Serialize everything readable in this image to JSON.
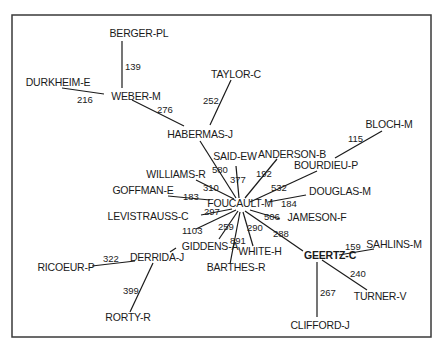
{
  "frame": {
    "x": 12,
    "y": 15,
    "width": 419,
    "height": 322
  },
  "nodes": [
    {
      "id": "BERGER-PL",
      "label": "BERGER-PL",
      "x": 139,
      "y": 37,
      "anchor": "middle"
    },
    {
      "id": "DURKHEIM-E",
      "label": "DURKHEIM-E",
      "x": 58,
      "y": 86,
      "anchor": "middle"
    },
    {
      "id": "WEBER-M",
      "label": "WEBER-M",
      "x": 136,
      "y": 100,
      "anchor": "middle"
    },
    {
      "id": "TAYLOR-C",
      "label": "TAYLOR-C",
      "x": 236,
      "y": 78,
      "anchor": "middle"
    },
    {
      "id": "HABERMAS-J",
      "label": "HABERMAS-J",
      "x": 200,
      "y": 138,
      "anchor": "middle"
    },
    {
      "id": "BLOCH-M",
      "label": "BLOCH-M",
      "x": 389,
      "y": 128,
      "anchor": "middle"
    },
    {
      "id": "SAID-EW",
      "label": "SAID-EW",
      "x": 235,
      "y": 160,
      "anchor": "middle"
    },
    {
      "id": "ANDERSON-B",
      "label": "ANDERSON-B",
      "x": 292,
      "y": 158,
      "anchor": "middle"
    },
    {
      "id": "BOURDIEU-P",
      "label": "BOURDIEU-P",
      "x": 326,
      "y": 169,
      "anchor": "middle"
    },
    {
      "id": "WILLIAMS-R",
      "label": "WILLIAMS-R",
      "x": 176,
      "y": 178,
      "anchor": "middle"
    },
    {
      "id": "DOUGLAS-M",
      "label": "DOUGLAS-M",
      "x": 340,
      "y": 195,
      "anchor": "middle"
    },
    {
      "id": "GOFFMAN-E",
      "label": "GOFFMAN-E",
      "x": 143,
      "y": 194,
      "anchor": "middle"
    },
    {
      "id": "FOUCAULT-M",
      "label": "FOUCAULT-M",
      "x": 240,
      "y": 207,
      "anchor": "middle"
    },
    {
      "id": "LEVISTRAUSS-C",
      "label": "LEVISTRAUSS-C",
      "x": 148,
      "y": 220,
      "anchor": "middle"
    },
    {
      "id": "JAMESON-F",
      "label": "JAMESON-F",
      "x": 317,
      "y": 221,
      "anchor": "middle"
    },
    {
      "id": "GIDDENS-A",
      "label": "GIDDENS-A",
      "x": 210,
      "y": 250,
      "anchor": "middle"
    },
    {
      "id": "WHITE-H",
      "label": "WHITE-H",
      "x": 260,
      "y": 255,
      "anchor": "middle"
    },
    {
      "id": "GEERTZ-C",
      "label": "GEERTZ-C",
      "x": 330,
      "y": 259,
      "anchor": "middle",
      "bold": true
    },
    {
      "id": "SAHLINS-M",
      "label": "SAHLINS-M",
      "x": 394,
      "y": 248,
      "anchor": "middle"
    },
    {
      "id": "DERRIDA-J",
      "label": "DERRIDA-J",
      "x": 157,
      "y": 261,
      "anchor": "middle"
    },
    {
      "id": "RICOEUR-P",
      "label": "RICOEUR-P",
      "x": 66,
      "y": 271,
      "anchor": "middle"
    },
    {
      "id": "BARTHES-R",
      "label": "BARTHES-R",
      "x": 236,
      "y": 271,
      "anchor": "middle"
    },
    {
      "id": "TURNER-V",
      "label": "TURNER-V",
      "x": 380,
      "y": 300,
      "anchor": "middle"
    },
    {
      "id": "RORTY-R",
      "label": "RORTY-R",
      "x": 128,
      "y": 321,
      "anchor": "middle"
    },
    {
      "id": "CLIFFORD-J",
      "label": "CLIFFORD-J",
      "x": 320,
      "y": 329,
      "anchor": "middle"
    }
  ],
  "edges": [
    {
      "from": "BERGER-PL",
      "to": "WEBER-M",
      "weight": "139",
      "x1": 122,
      "y1": 41,
      "x2": 122,
      "y2": 88,
      "lx": 125,
      "ly": 70
    },
    {
      "from": "DURKHEIM-E",
      "to": "WEBER-M",
      "weight": "216",
      "x1": 62,
      "y1": 88,
      "x2": 104,
      "y2": 94,
      "lx": 77,
      "ly": 103
    },
    {
      "from": "WEBER-M",
      "to": "HABERMAS-J",
      "weight": "276",
      "x1": 132,
      "y1": 100,
      "x2": 184,
      "y2": 126,
      "lx": 157,
      "ly": 113
    },
    {
      "from": "TAYLOR-C",
      "to": "HABERMAS-J",
      "weight": "252",
      "x1": 231,
      "y1": 80,
      "x2": 210,
      "y2": 125,
      "lx": 203,
      "ly": 104
    },
    {
      "from": "HABERMAS-J",
      "to": "FOUCAULT-M",
      "weight": "580",
      "x1": 200,
      "y1": 141,
      "x2": 236,
      "y2": 198,
      "lx": 212,
      "ly": 173
    },
    {
      "from": "SAID-EW",
      "to": "FOUCAULT-M",
      "weight": "377",
      "x1": 236,
      "y1": 166,
      "x2": 239,
      "y2": 198,
      "lx": 230,
      "ly": 183
    },
    {
      "from": "ANDERSON-B",
      "to": "FOUCAULT-M",
      "weight": "192",
      "x1": 277,
      "y1": 159,
      "x2": 245,
      "y2": 198,
      "lx": 256,
      "ly": 177
    },
    {
      "from": "BLOCH-M",
      "to": "BOURDIEU-P",
      "weight": "115",
      "x1": 382,
      "y1": 131,
      "x2": 335,
      "y2": 158,
      "lx": 348,
      "ly": 142
    },
    {
      "from": "BOURDIEU-P",
      "to": "FOUCAULT-M",
      "weight": "532",
      "x1": 317,
      "y1": 171,
      "x2": 250,
      "y2": 202,
      "lx": 271,
      "ly": 191
    },
    {
      "from": "WILLIAMS-R",
      "to": "FOUCAULT-M",
      "weight": "310",
      "x1": 196,
      "y1": 180,
      "x2": 234,
      "y2": 199,
      "lx": 203,
      "ly": 191
    },
    {
      "from": "DOUGLAS-M",
      "to": "FOUCAULT-M",
      "weight": "184",
      "x1": 306,
      "y1": 195,
      "x2": 268,
      "y2": 202,
      "lx": 281,
      "ly": 207
    },
    {
      "from": "GOFFMAN-E",
      "to": "FOUCAULT-M",
      "weight": "183",
      "x1": 168,
      "y1": 196,
      "x2": 210,
      "y2": 200,
      "lx": 183,
      "ly": 200
    },
    {
      "from": "LEVISTRAUSS-C",
      "to": "FOUCAULT-M",
      "weight": "297",
      "x1": 201,
      "y1": 215,
      "x2": 232,
      "y2": 209,
      "lx": 204,
      "ly": 215
    },
    {
      "from": "FOUCAULT-M",
      "to": "JAMESON-F",
      "weight": "506",
      "x1": 250,
      "y1": 210,
      "x2": 280,
      "y2": 219,
      "lx": 264,
      "ly": 220
    },
    {
      "from": "FOUCAULT-M",
      "to": "DERRIDA-J",
      "weight": "1103",
      "x1": 236,
      "y1": 210,
      "x2": 196,
      "y2": 229,
      "lx": 182,
      "ly": 234
    },
    {
      "from": "FOUCAULT-M",
      "to": "GIDDENS-A",
      "weight": "259",
      "x1": 238,
      "y1": 211,
      "x2": 219,
      "y2": 239,
      "lx": 218,
      "ly": 230
    },
    {
      "from": "FOUCAULT-M",
      "to": "BARTHES-R",
      "weight": "891",
      "x1": 240,
      "y1": 212,
      "x2": 230,
      "y2": 264,
      "lx": 230,
      "ly": 244
    },
    {
      "from": "FOUCAULT-M",
      "to": "WHITE-H",
      "weight": "290",
      "x1": 243,
      "y1": 212,
      "x2": 253,
      "y2": 246,
      "lx": 247,
      "ly": 231
    },
    {
      "from": "FOUCAULT-M",
      "to": "GEERTZ-C",
      "weight": "288",
      "x1": 245,
      "y1": 211,
      "x2": 303,
      "y2": 251,
      "lx": 273,
      "ly": 237
    },
    {
      "from": "GIDDENS-A",
      "to": "DERRIDA-J",
      "weight": "",
      "x1": 176,
      "y1": 248,
      "x2": 170,
      "y2": 252,
      "lx": 0,
      "ly": 0
    },
    {
      "from": "GEERTZ-C",
      "to": "SAHLINS-M",
      "weight": "159",
      "x1": 339,
      "y1": 255,
      "x2": 374,
      "y2": 249,
      "lx": 345,
      "ly": 250
    },
    {
      "from": "GEERTZ-C",
      "to": "TURNER-V",
      "weight": "240",
      "x1": 322,
      "y1": 260,
      "x2": 367,
      "y2": 290,
      "lx": 350,
      "ly": 277
    },
    {
      "from": "GEERTZ-C",
      "to": "CLIFFORD-J",
      "weight": "267",
      "x1": 317,
      "y1": 262,
      "x2": 317,
      "y2": 317,
      "lx": 320,
      "ly": 296
    },
    {
      "from": "DERRIDA-J",
      "to": "RICOEUR-P",
      "weight": "322",
      "x1": 92,
      "y1": 266,
      "x2": 135,
      "y2": 261,
      "lx": 103,
      "ly": 262
    },
    {
      "from": "DERRIDA-J",
      "to": "RORTY-R",
      "weight": "399",
      "x1": 153,
      "y1": 263,
      "x2": 130,
      "y2": 312,
      "lx": 123,
      "ly": 294
    }
  ]
}
